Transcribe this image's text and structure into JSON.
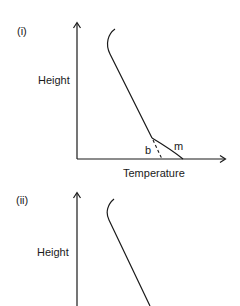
{
  "panels": [
    {
      "id": "i",
      "label": "(i)",
      "y_axis_label": "Height",
      "x_axis_label": "Temperature",
      "curve_labels": {
        "b": "b",
        "m": "m"
      }
    },
    {
      "id": "ii",
      "label": "(ii)",
      "y_axis_label": "Height"
    }
  ]
}
